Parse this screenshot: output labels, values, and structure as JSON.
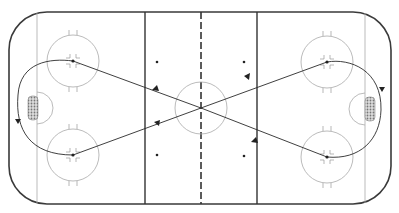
{
  "diagram": {
    "type": "hockey-rink-drill",
    "colors": {
      "board": "#3a3a3a",
      "line": "#999999",
      "path": "#2a2a2a",
      "redline": "#333333"
    },
    "elements": [
      "boards",
      "goal-lines",
      "blue-lines",
      "center-line",
      "center-circle",
      "faceoff-circles",
      "creases",
      "nets",
      "neutral-dots",
      "skating-path"
    ]
  }
}
